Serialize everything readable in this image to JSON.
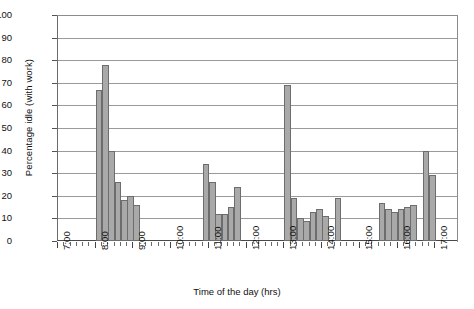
{
  "chart_data": {
    "type": "bar",
    "title": "",
    "xlabel": "Time of the day (hrs)",
    "ylabel": "Percentage idle (with work)",
    "ylim": [
      0,
      100
    ],
    "ytick_step": 10,
    "yticks": [
      100,
      90,
      80,
      70,
      60,
      50,
      40,
      30,
      20,
      10,
      0
    ],
    "grid": true,
    "legend": "none",
    "x_axis_type": "time-of-day",
    "x_range": [
      "7:00",
      "17:00"
    ],
    "x_hour_labels": [
      "7:00",
      "8:00",
      "9:00",
      "10:00",
      "11:00",
      "12:00",
      "13:00",
      "14:00",
      "15:00",
      "16:00",
      "17:00"
    ],
    "x_minor_tick_interval_minutes": 10,
    "bar_fill_color": "#a9a9a9",
    "bar_border_color": "#6d6d6d",
    "categories": [
      "8:00",
      "8:10",
      "8:20",
      "8:30",
      "8:40",
      "8:50",
      "9:00",
      "9:10",
      "10:50",
      "11:00",
      "11:10",
      "11:20",
      "11:30",
      "11:40",
      "13:00",
      "13:10",
      "13:20",
      "13:30",
      "13:40",
      "13:50",
      "14:00",
      "14:10",
      "14:20",
      "15:30",
      "15:40",
      "15:50",
      "16:00",
      "16:10",
      "16:20",
      "16:40",
      "16:50"
    ],
    "values": [
      67,
      78,
      40,
      26,
      18,
      20,
      19,
      16,
      34,
      26,
      12,
      12,
      15,
      24,
      69,
      19,
      10,
      9,
      13,
      14,
      11,
      19,
      0,
      17,
      14,
      13,
      14,
      15,
      16,
      40,
      29
    ],
    "bars": [
      {
        "time": "8:00",
        "value": 67
      },
      {
        "time": "8:10",
        "value": 78
      },
      {
        "time": "8:20",
        "value": 40
      },
      {
        "time": "8:30",
        "value": 26
      },
      {
        "time": "8:40",
        "value": 18
      },
      {
        "time": "8:50",
        "value": 20
      },
      {
        "time": "9:00",
        "value": 16
      },
      {
        "time": "10:50",
        "value": 34
      },
      {
        "time": "11:00",
        "value": 26
      },
      {
        "time": "11:10",
        "value": 12
      },
      {
        "time": "11:20",
        "value": 12
      },
      {
        "time": "11:30",
        "value": 15
      },
      {
        "time": "11:40",
        "value": 24
      },
      {
        "time": "13:00",
        "value": 69
      },
      {
        "time": "13:10",
        "value": 19
      },
      {
        "time": "13:20",
        "value": 10
      },
      {
        "time": "13:30",
        "value": 9
      },
      {
        "time": "13:40",
        "value": 13
      },
      {
        "time": "13:50",
        "value": 14
      },
      {
        "time": "14:00",
        "value": 11
      },
      {
        "time": "14:20",
        "value": 19
      },
      {
        "time": "15:30",
        "value": 17
      },
      {
        "time": "15:40",
        "value": 14
      },
      {
        "time": "15:50",
        "value": 13
      },
      {
        "time": "16:00",
        "value": 14
      },
      {
        "time": "16:10",
        "value": 15
      },
      {
        "time": "16:20",
        "value": 16
      },
      {
        "time": "16:40",
        "value": 40
      },
      {
        "time": "16:50",
        "value": 29
      }
    ]
  },
  "axes": {
    "y_labels": [
      "100",
      "90",
      "80",
      "70",
      "60",
      "50",
      "40",
      "30",
      "20",
      "10",
      "0"
    ],
    "x_labels": [
      "7:00",
      "8:00",
      "9:00",
      "10:00",
      "11:00",
      "12:00",
      "13:00",
      "14:00",
      "15:00",
      "16:00",
      "17:00"
    ],
    "y_title": "Percentage idle (with work)",
    "x_title": "Time of the day (hrs)"
  }
}
